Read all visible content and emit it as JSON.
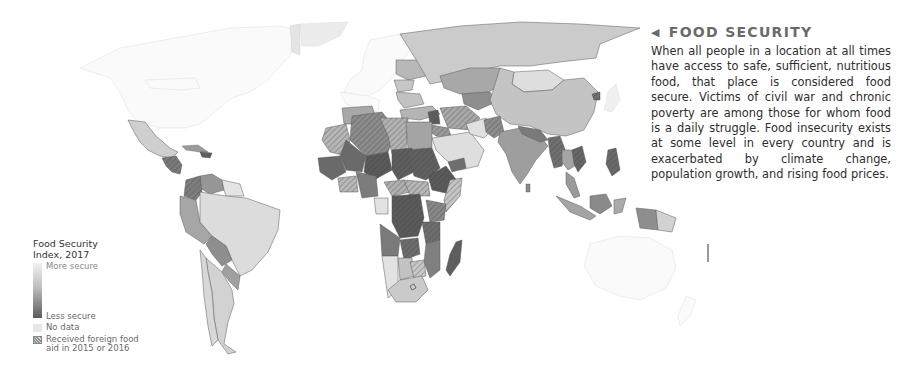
{
  "info_panel": {
    "arrow_icon": "left-triangle",
    "title": "FOOD SECURITY",
    "body": "When all people in a location at all times have access to safe, sufficient, nutritious food, that place is considered food secure. Victims of civil war and chronic poverty are among those for whom food is a daily struggle. Food insecurity exists at some level in every country and is exacerbated by climate change, population growth, and rising food prices."
  },
  "legend": {
    "title_line1": "Food Security",
    "title_line2": "Index, 2017",
    "scale_top": "More secure",
    "scale_bottom": "Less secure",
    "no_data": "No data",
    "hatch_line1": "Received foreign food",
    "hatch_line2": "aid in 2015 or 2016",
    "colors": {
      "more_secure": "#f2f2f2",
      "mid": "#bdbdbd",
      "less_secure": "#5c5c5c",
      "no_data": "#e6e6e6"
    }
  },
  "map": {
    "type": "choropleth world map (grayscale)",
    "regions": [
      {
        "name": "North America (US/Canada)",
        "shade": "more secure / light"
      },
      {
        "name": "Mexico",
        "shade": "light-mid"
      },
      {
        "name": "Central America / Haiti",
        "shade": "less secure",
        "aid": true
      },
      {
        "name": "Colombia",
        "shade": "mid",
        "aid": true
      },
      {
        "name": "Brazil",
        "shade": "light"
      },
      {
        "name": "Bolivia/Paraguay",
        "shade": "mid"
      },
      {
        "name": "Europe",
        "shade": "more secure"
      },
      {
        "name": "Russia",
        "shade": "light-mid"
      },
      {
        "name": "China",
        "shade": "light-mid"
      },
      {
        "name": "Mongolia",
        "shade": "light"
      },
      {
        "name": "India",
        "shade": "mid"
      },
      {
        "name": "Southeast Asia",
        "shade": "mid-dark",
        "aid": true
      },
      {
        "name": "Indonesia",
        "shade": "mid"
      },
      {
        "name": "North Africa (Algeria/Libya)",
        "shade": "mid",
        "aid": true
      },
      {
        "name": "Sahel / Central Africa",
        "shade": "less secure",
        "aid": true
      },
      {
        "name": "Southern Africa",
        "shade": "light-mid"
      },
      {
        "name": "Madagascar",
        "shade": "less secure"
      },
      {
        "name": "Australia",
        "shade": "more secure"
      }
    ]
  }
}
